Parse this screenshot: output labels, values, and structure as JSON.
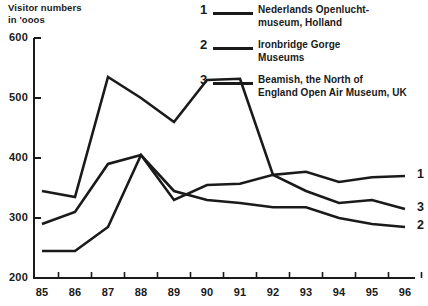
{
  "axis_title": "Visitor numbers\nin 'ooos",
  "legend": [
    {
      "num": "1",
      "text": "Nederlands Openlucht-\nmuseum, Holland"
    },
    {
      "num": "2",
      "text": "Ironbridge Gorge\nMuseums"
    },
    {
      "num": "3",
      "text": "Beamish, the North of\nEngland Open Air Museum, UK"
    }
  ],
  "series_tags": [
    {
      "label": "1"
    },
    {
      "label": "3"
    },
    {
      "label": "2"
    }
  ],
  "chart_data": {
    "type": "line",
    "title": "Visitor numbers in 'ooos",
    "xlabel": "",
    "ylabel": "Visitor numbers in 'ooos",
    "xlim": [
      85,
      96
    ],
    "ylim": [
      200,
      600
    ],
    "ytick_labels": [
      "600",
      "500",
      "400",
      "300",
      "200"
    ],
    "yticks": [
      600,
      500,
      400,
      300,
      200
    ],
    "xtick_labels": [
      "85",
      "86",
      "87",
      "88",
      "89",
      "90",
      "91",
      "92",
      "93",
      "94",
      "95",
      "96"
    ],
    "x": [
      85,
      86,
      87,
      88,
      89,
      90,
      91,
      92,
      93,
      94,
      95,
      96
    ],
    "grid": false,
    "legend_position": "top-right",
    "series": [
      {
        "name": "Nederlands Openluchtmuseum, Holland",
        "key": "1",
        "values": [
          345,
          335,
          535,
          500,
          460,
          530,
          532,
          372,
          377,
          360,
          368,
          370
        ]
      },
      {
        "name": "Ironbridge Gorge Museums",
        "key": "2",
        "values": [
          245,
          245,
          285,
          405,
          345,
          330,
          325,
          318,
          318,
          300,
          290,
          285
        ]
      },
      {
        "name": "Beamish, the North of England Open Air Museum, UK",
        "key": "3",
        "values": [
          290,
          310,
          390,
          405,
          330,
          355,
          357,
          372,
          345,
          325,
          330,
          315
        ]
      }
    ]
  }
}
